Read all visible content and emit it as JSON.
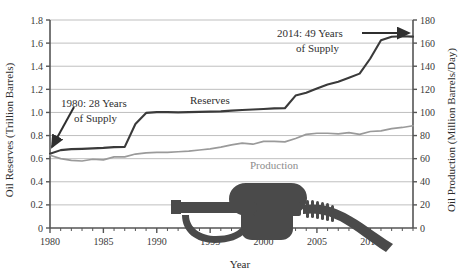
{
  "chart_data": {
    "type": "line",
    "title": "",
    "xlabel": "Year",
    "ylabel": "Oil Reserves (Trillion Barrels)",
    "y2label": "Oil Production (Million Barrels/Day)",
    "grid": true,
    "legend_position": "inline-labels",
    "xlim": [
      1980,
      2014
    ],
    "ylim": [
      0,
      1.8
    ],
    "y2lim": [
      0,
      180
    ],
    "xticks": [
      1980,
      1985,
      1990,
      1995,
      2000,
      2005,
      2010
    ],
    "xtick_labels": [
      "1980",
      "1985",
      "1990",
      "1995",
      "2000",
      "2005",
      "2010"
    ],
    "yticks": [
      0,
      0.2,
      0.4,
      0.6,
      0.8,
      1.0,
      1.2,
      1.4,
      1.6,
      1.8
    ],
    "ytick_labels": [
      "0",
      "0.2",
      "0.4",
      "0.6",
      "0.8",
      "1.0",
      "1.2",
      "1.4",
      "1.6",
      "1.8"
    ],
    "y2ticks": [
      0,
      20,
      40,
      60,
      80,
      100,
      120,
      140,
      160,
      180
    ],
    "y2tick_labels": [
      "0",
      "20",
      "40",
      "60",
      "80",
      "100",
      "120",
      "140",
      "160",
      "180"
    ],
    "x": [
      1980,
      1981,
      1982,
      1983,
      1984,
      1985,
      1986,
      1987,
      1988,
      1989,
      1990,
      1991,
      1992,
      1993,
      1994,
      1995,
      1996,
      1997,
      1998,
      1999,
      2000,
      2001,
      2002,
      2003,
      2004,
      2005,
      2006,
      2007,
      2008,
      2009,
      2010,
      2011,
      2012,
      2013,
      2014
    ],
    "series": [
      {
        "name": "Reserves",
        "axis": "left",
        "color": "#3a3a3a",
        "units": "Trillion Barrels",
        "values": [
          0.642,
          0.674,
          0.683,
          0.685,
          0.689,
          0.693,
          0.7,
          0.702,
          0.9,
          0.996,
          1.003,
          1.003,
          1.001,
          1.003,
          1.005,
          1.007,
          1.009,
          1.016,
          1.021,
          1.025,
          1.03,
          1.035,
          1.036,
          1.146,
          1.17,
          1.208,
          1.241,
          1.266,
          1.3,
          1.336,
          1.467,
          1.625,
          1.655,
          1.66,
          1.656
        ]
      },
      {
        "name": "Production",
        "axis": "right",
        "color": "#9a9a9a",
        "units": "Million Barrels/Day",
        "values": [
          63.0,
          60.0,
          58.5,
          58.0,
          59.5,
          59.0,
          61.5,
          61.5,
          64.0,
          65.0,
          65.5,
          65.5,
          66.0,
          66.5,
          67.5,
          68.5,
          70.0,
          72.0,
          73.5,
          72.5,
          75.0,
          75.0,
          74.5,
          77.5,
          81.0,
          82.0,
          82.0,
          81.5,
          82.5,
          81.0,
          83.5,
          84.0,
          86.0,
          87.0,
          88.5
        ]
      }
    ],
    "annotations": [
      {
        "id": "anno-1980",
        "line1": "1980:  28 Years",
        "line2": "of Supply",
        "points_to_year": 1980,
        "arrow": "down-left"
      },
      {
        "id": "anno-2014",
        "line1": "2014:  49 Years",
        "line2": "of Supply",
        "points_to_year": 2014,
        "arrow": "right"
      }
    ],
    "inline_labels": [
      {
        "text": "Reserves",
        "series": "Reserves"
      },
      {
        "text": "Production",
        "series": "Production"
      }
    ],
    "decorations": [
      {
        "name": "gas-nozzle-icon",
        "color": "#4a4a4a"
      }
    ]
  },
  "colors": {
    "reserves": "#3a3a3a",
    "production": "#9a9a9a",
    "grid": "#bfbfbf",
    "axis": "#555555",
    "text": "#2f2f2f",
    "nozzle": "#4a4a4a"
  }
}
